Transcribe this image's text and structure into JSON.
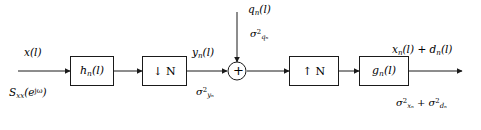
{
  "diagram": {
    "stroke_color": "#1a1a1a",
    "background": "#ffffff",
    "blocks": [
      {
        "id": "analysis-filter",
        "label": "h",
        "sub": "n",
        "tail": "(l)",
        "kind": "filter"
      },
      {
        "id": "downsampler",
        "label": "↓ N",
        "kind": "rate"
      },
      {
        "id": "upsampler",
        "label": "↑ N",
        "kind": "rate"
      },
      {
        "id": "synthesis-filter",
        "label": "g",
        "sub": "n",
        "tail": "(l)",
        "kind": "filter"
      }
    ],
    "adder": {
      "id": "summing-junction",
      "symbol": "+"
    },
    "labels": {
      "input_signal": {
        "base": "x",
        "tail": "(l)"
      },
      "input_psd": {
        "base": "S",
        "sub": "xx",
        "tail": "(e",
        "sup": "jω",
        "close": ")"
      },
      "subband_signal": {
        "base": "y",
        "sub": "n",
        "tail": "(l)"
      },
      "subband_variance": {
        "base": "σ",
        "sup": "2",
        "sub": "yₙ"
      },
      "noise_signal": {
        "base": "q",
        "sub": "n",
        "tail": "(l)"
      },
      "noise_variance": {
        "base": "σ",
        "sup": "2",
        "sub": "qₙ"
      },
      "output_signal": {
        "first": "x",
        "first_sub": "n",
        "first_tail": "(l)",
        "op": "+",
        "second": "d",
        "second_sub": "n",
        "second_tail": "(l)"
      },
      "output_variance": {
        "first": "σ",
        "first_sup": "2",
        "first_sub": "xₙ",
        "op": "+",
        "second": "σ",
        "second_sup": "2",
        "second_sub": "dₙ"
      }
    },
    "text": {
      "input_signal": "x(l)",
      "input_psd": "Sxx(ejω)",
      "subband_signal": "yn(l)",
      "subband_variance": "σ²yn",
      "noise_signal": "qn(l)",
      "noise_variance": "σ²qn",
      "downsampler_label": "↓ N",
      "upsampler_label": "↑ N",
      "analysis_filter_label": "hn(l)",
      "synthesis_filter_label": "gn(l)",
      "adder_symbol": "+",
      "output_signal": "xn(l) + dn(l)",
      "output_variance": "σ²xn + σ²dn"
    }
  }
}
